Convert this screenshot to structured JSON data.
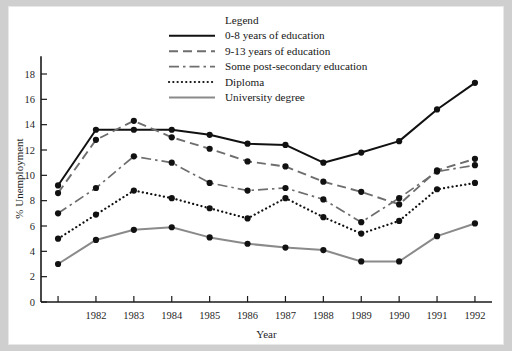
{
  "chart_data": {
    "type": "line",
    "title": "",
    "xlabel": "Year",
    "ylabel": "% Unemployment",
    "x": [
      1981,
      1982,
      1983,
      1984,
      1985,
      1986,
      1987,
      1988,
      1989,
      1990,
      1991,
      1992
    ],
    "xtick_labels": [
      "",
      "1982",
      "1983",
      "1984",
      "1985",
      "1986",
      "1987",
      "1988",
      "1989",
      "1990",
      "1991",
      "1992"
    ],
    "ytick_labels": [
      "0",
      "2",
      "4",
      "6",
      "8",
      "10",
      "12",
      "14",
      "16",
      "18"
    ],
    "yticks": [
      0,
      2,
      4,
      6,
      8,
      10,
      12,
      14,
      16,
      18
    ],
    "ylim": [
      0,
      19.5
    ],
    "xlim": [
      1980.55,
      1992.45
    ],
    "grid": false,
    "legend_position": "top-center",
    "legend_title": "Legend",
    "series": [
      {
        "name": "0-8 years of education",
        "style": "solid",
        "color": "#111111",
        "width": 2.0,
        "values": [
          9.2,
          13.6,
          13.6,
          13.6,
          13.2,
          12.5,
          12.4,
          11.0,
          11.8,
          12.7,
          15.2,
          17.3
        ]
      },
      {
        "name": "9-13 years of education",
        "style": "dashed",
        "color": "#6e6e6e",
        "width": 1.9,
        "values": [
          8.6,
          12.8,
          14.3,
          13.0,
          12.1,
          11.1,
          10.7,
          9.5,
          8.7,
          7.7,
          10.4,
          11.3
        ]
      },
      {
        "name": "Some post-secondary education",
        "style": "dashdot",
        "color": "#6e6e6e",
        "width": 1.7,
        "values": [
          7.0,
          9.0,
          11.5,
          11.0,
          9.4,
          8.8,
          9.0,
          8.1,
          6.3,
          8.2,
          10.3,
          10.8
        ]
      },
      {
        "name": "Diploma",
        "style": "dotted",
        "color": "#111111",
        "width": 2.2,
        "values": [
          5.0,
          6.9,
          8.8,
          8.2,
          7.4,
          6.6,
          8.2,
          6.7,
          5.4,
          6.4,
          8.9,
          9.4
        ]
      },
      {
        "name": "University degree",
        "style": "solid-gray",
        "color": "#8a8a8a",
        "width": 2.0,
        "values": [
          3.0,
          4.9,
          5.7,
          5.9,
          5.1,
          4.6,
          4.3,
          4.1,
          3.2,
          3.2,
          5.2,
          6.2
        ]
      }
    ]
  }
}
